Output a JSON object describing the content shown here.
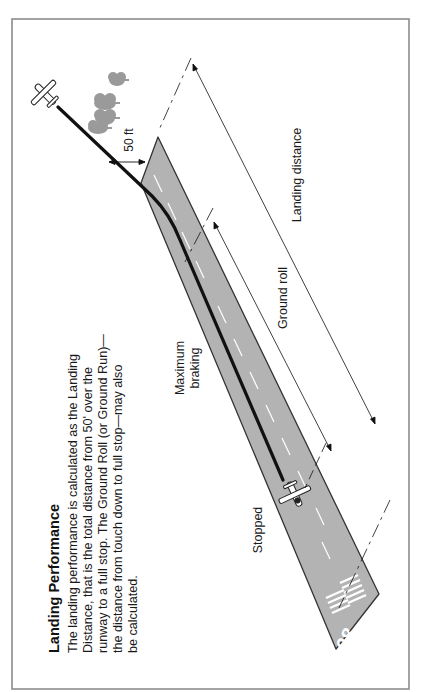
{
  "figure": {
    "title": "Landing Performance",
    "caption_lines": [
      "The landing performance is calculated as the Landing",
      "Distance, that is the total distance from 50' over the",
      "runway to a full stop. The Ground Roll (or Ground Run)—",
      "the distance from touch down to full stop—may also",
      "be calculated."
    ],
    "labels": {
      "obstacle_height": "50 ft",
      "landing_distance": "Landing distance",
      "ground_roll": "Ground roll",
      "max_braking_line1": "Maximum",
      "max_braking_line2": "braking",
      "stopped": "Stopped",
      "runway_number": "08"
    },
    "icons": {
      "approaching_aircraft": "airplane-icon",
      "stopped_aircraft": "airplane-icon",
      "trees": "tree-icon"
    },
    "colors": {
      "runway": "#b3b3b3",
      "runway_edge": "#333333",
      "flight_path": "#111111",
      "trees": "#9a9a9a",
      "border": "#8c8c8c",
      "markings": "#ffffff"
    }
  }
}
